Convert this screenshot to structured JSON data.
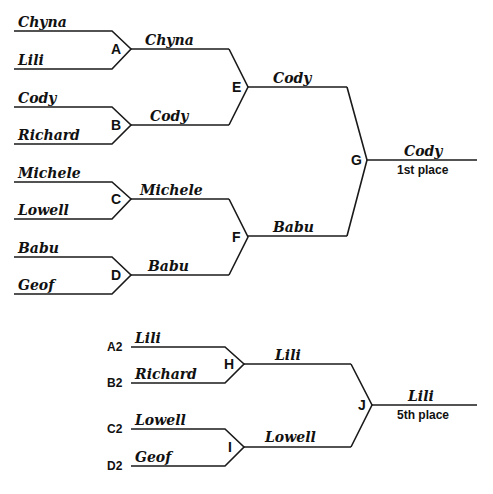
{
  "main_bracket": {
    "round1": [
      {
        "node": "A",
        "top": "Chyna",
        "bottom": "Lili",
        "winner": "Chyna"
      },
      {
        "node": "B",
        "top": "Cody",
        "bottom": "Richard",
        "winner": "Cody"
      },
      {
        "node": "C",
        "top": "Michele",
        "bottom": "Lowell",
        "winner": "Michele"
      },
      {
        "node": "D",
        "top": "Babu",
        "bottom": "Geof",
        "winner": "Babu"
      }
    ],
    "round2": [
      {
        "node": "E",
        "winner": "Cody"
      },
      {
        "node": "F",
        "winner": "Babu"
      }
    ],
    "final": {
      "node": "G",
      "winner": "Cody",
      "place": "1st place"
    }
  },
  "consolation_bracket": {
    "round1": [
      {
        "node": "H",
        "top_seed": "A2",
        "top": "Lili",
        "bottom_seed": "B2",
        "bottom": "Richard",
        "winner": "Lili"
      },
      {
        "node": "I",
        "top_seed": "C2",
        "top": "Lowell",
        "bottom_seed": "D2",
        "bottom": "Geof",
        "winner": "Lowell"
      }
    ],
    "final": {
      "node": "J",
      "winner": "Lili",
      "place": "5th place"
    }
  },
  "colors": {
    "line": "#1a1a1a",
    "text": "#111111",
    "background": "#ffffff"
  }
}
